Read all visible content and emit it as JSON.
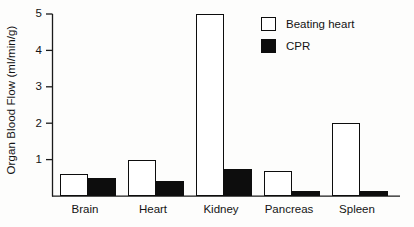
{
  "chart_data": {
    "type": "bar",
    "title": "",
    "subtitle": "",
    "xlabel": "",
    "ylabel": "Organ Blood Flow (ml/min/g)",
    "categories": [
      "Brain",
      "Heart",
      "Kidney",
      "Pancreas",
      "Spleen"
    ],
    "series": [
      {
        "name": "Beating heart",
        "swatch": "open",
        "color": "#ffffff",
        "values": [
          0.6,
          1.0,
          5.0,
          0.7,
          2.0
        ]
      },
      {
        "name": "CPR",
        "swatch": "filled",
        "color": "#0d0d0d",
        "values": [
          0.5,
          0.42,
          0.75,
          0.15,
          0.15
        ]
      }
    ],
    "ylim": [
      0,
      5
    ],
    "yticks": [
      1,
      2,
      3,
      4,
      5
    ],
    "ytick_labels": [
      "1",
      "2",
      "3",
      "4",
      "5"
    ],
    "grid": false,
    "legend_position": "top-right",
    "annotations": []
  },
  "legend": {
    "entries": [
      {
        "label": "Beating heart",
        "swatch": "open"
      },
      {
        "label": "CPR",
        "swatch": "filled"
      }
    ]
  },
  "axes": {
    "y_title": "Organ Blood Flow (ml/min/g)",
    "tick_1": "1",
    "tick_2": "2",
    "tick_3": "3",
    "tick_4": "4",
    "tick_5": "5"
  },
  "categories": {
    "c0": "Brain",
    "c1": "Heart",
    "c2": "Kidney",
    "c3": "Pancreas",
    "c4": "Spleen"
  }
}
